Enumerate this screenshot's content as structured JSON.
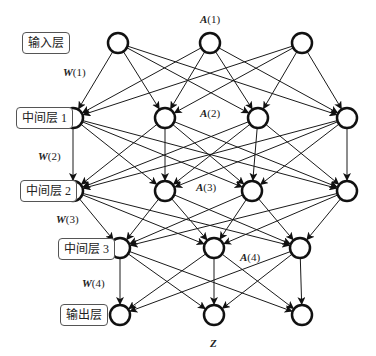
{
  "diagram": {
    "type": "neural-network",
    "layers": [
      {
        "id": "input",
        "label": "输入层",
        "y": 43,
        "nodes_x": [
          118,
          210,
          302
        ],
        "label_pos": [
          22,
          32
        ]
      },
      {
        "id": "hidden1",
        "label": "中间层 1",
        "y": 118,
        "nodes_x": [
          73,
          165,
          258,
          347
        ],
        "label_pos": [
          16,
          107
        ]
      },
      {
        "id": "hidden2",
        "label": "中间层 2",
        "y": 191,
        "nodes_x": [
          73,
          165,
          252,
          347
        ],
        "label_pos": [
          20,
          180
        ]
      },
      {
        "id": "hidden3",
        "label": "中间层 3",
        "y": 248,
        "nodes_x": [
          120,
          214,
          300
        ],
        "label_pos": [
          58,
          238
        ]
      },
      {
        "id": "output",
        "label": "输出层",
        "y": 315,
        "nodes_x": [
          120,
          214,
          302
        ],
        "label_pos": [
          60,
          304
        ]
      }
    ],
    "weight_labels": [
      {
        "bold": "W",
        "text": "(1)",
        "pos": [
          63,
          66
        ]
      },
      {
        "bold": "W",
        "text": "(2)",
        "pos": [
          38,
          150
        ]
      },
      {
        "bold": "W",
        "text": "(3)",
        "pos": [
          56,
          213
        ]
      },
      {
        "bold": "W",
        "text": "(4)",
        "pos": [
          82,
          277
        ]
      }
    ],
    "activation_labels": [
      {
        "bold": "A",
        "text": "(1)",
        "pos": [
          200,
          13
        ]
      },
      {
        "bold": "A",
        "text": "(2)",
        "pos": [
          200,
          107
        ]
      },
      {
        "bold": "A",
        "text": "(3)",
        "pos": [
          196,
          181
        ]
      },
      {
        "bold": "A",
        "text": "(4)",
        "pos": [
          240,
          251
        ]
      }
    ],
    "output_label": {
      "text": "Z",
      "pos": [
        210,
        337
      ]
    },
    "node_radius": 10,
    "stroke_color": "#111111",
    "edge_color": "#1a1a1a"
  }
}
